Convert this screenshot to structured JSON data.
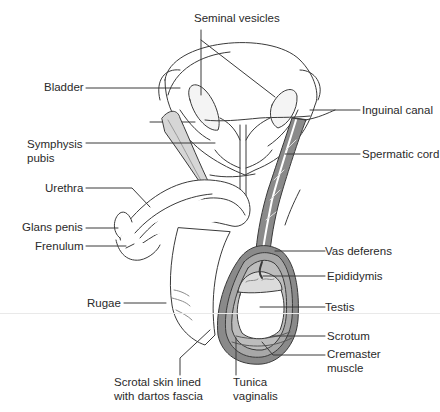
{
  "figure": {
    "colors": {
      "line": "#3a3a3a",
      "shade_dark": "#7a7a7a",
      "shade_mid": "#a8a8a8",
      "shade_light": "#d6d6d6",
      "background": "#ffffff",
      "label_text": "#2a2a2a"
    }
  },
  "labels": {
    "seminal_vesicles": "Seminal vesicles",
    "bladder": "Bladder",
    "inguinal_canal": "Inguinal canal",
    "symphysis_pubis": "Symphysis\npubis",
    "spermatic_cord": "Spermatic cord",
    "urethra": "Urethra",
    "glans_penis": "Glans penis",
    "frenulum": "Frenulum",
    "vas_deferens": "Vas deferens",
    "epididymis": "Epididymis",
    "rugae": "Rugae",
    "testis": "Testis",
    "scrotum": "Scrotum",
    "cremaster_muscle": "Cremaster\nmuscle",
    "scrotal_skin": "Scrotal skin lined\nwith dartos fascia",
    "tunica_vaginalis": "Tunica\nvaginalis"
  }
}
